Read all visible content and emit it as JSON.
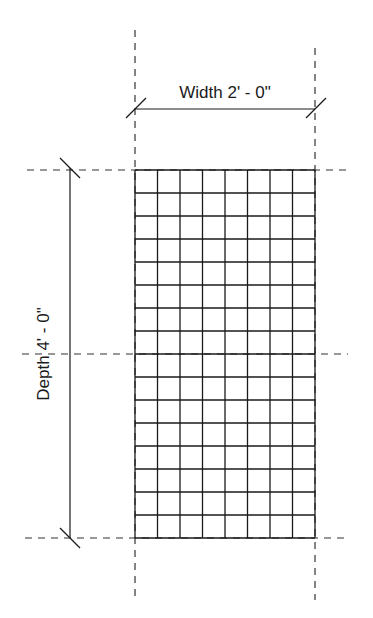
{
  "diagram": {
    "type": "dimensioned-grid-plan",
    "width_label": "Width 2' - 0\"",
    "depth_label": "Depth 4' - 0\"",
    "grid": {
      "columns": 8,
      "rows": 16,
      "left": 135,
      "top": 170,
      "right": 315,
      "bottom": 538
    },
    "colors": {
      "line": "#1a1a1a",
      "dashed": "#333333",
      "background": "#ffffff"
    }
  }
}
